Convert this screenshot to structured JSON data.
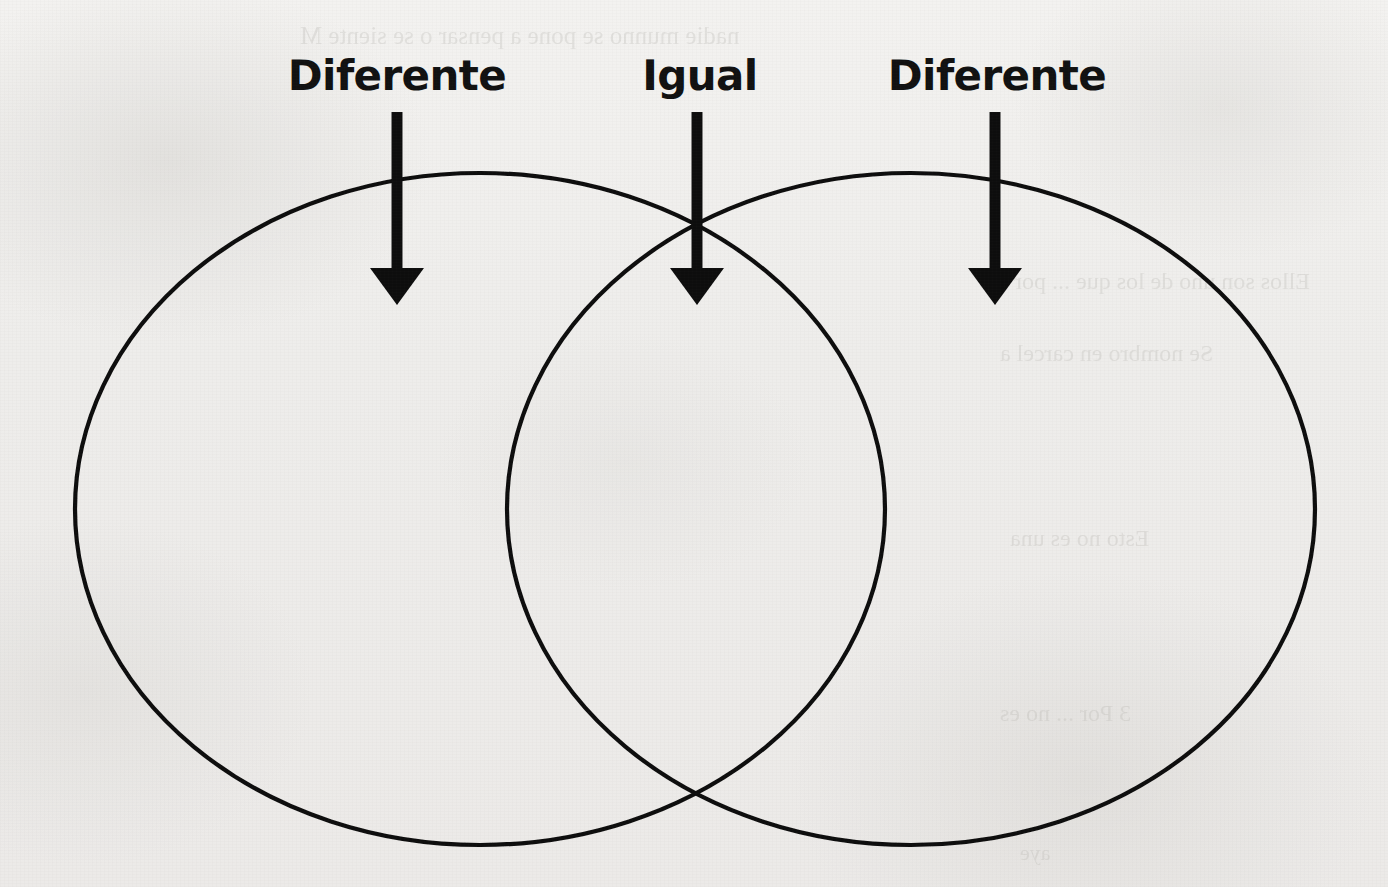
{
  "worksheet": {
    "diagram_type": "venn-diagram",
    "language": "es",
    "background_color": "#efeeec",
    "ink_color": "#111111"
  },
  "labels": [
    {
      "id": "left",
      "text": "Diferente",
      "x": 397,
      "y": 55,
      "region": "left-only"
    },
    {
      "id": "center",
      "text": "Igual",
      "x": 700,
      "y": 55,
      "region": "intersection"
    },
    {
      "id": "right",
      "text": "Diferente",
      "x": 997,
      "y": 55,
      "region": "right-only"
    }
  ],
  "arrows": [
    {
      "id": "arrow-left",
      "x": 397,
      "y_start": 112,
      "y_tip": 305,
      "points_to": "left-only"
    },
    {
      "id": "arrow-center",
      "x": 697,
      "y_start": 112,
      "y_tip": 305,
      "points_to": "intersection"
    },
    {
      "id": "arrow-right",
      "x": 995,
      "y_start": 112,
      "y_tip": 305,
      "points_to": "right-only"
    }
  ],
  "circles": [
    {
      "id": "left-circle",
      "cx": 480,
      "cy": 509,
      "rx": 405,
      "ry": 336
    },
    {
      "id": "right-circle",
      "cx": 911,
      "cy": 509,
      "rx": 404,
      "ry": 336
    }
  ],
  "intersections": [
    {
      "id": "top",
      "x": 697,
      "y": 227
    },
    {
      "id": "bottom",
      "x": 697,
      "y": 793
    }
  ],
  "show_through": [
    {
      "text": "nadie   munno   se   pone   a   pensar   o   se   siente   M",
      "x": 300,
      "y": 22,
      "size": 25
    },
    {
      "text": "Ellos   son   uno   de   los   que   ...   por   los",
      "x": 980,
      "y": 268,
      "size": 24
    },
    {
      "text": "Se   nombro   en   carcel   a",
      "x": 1000,
      "y": 340,
      "size": 24
    },
    {
      "text": "Esto   no   es   una",
      "x": 1010,
      "y": 525,
      "size": 24
    },
    {
      "text": "3   Por   ...   no   es",
      "x": 1000,
      "y": 700,
      "size": 24
    },
    {
      "text": "aye",
      "x": 1020,
      "y": 840,
      "size": 22
    }
  ]
}
